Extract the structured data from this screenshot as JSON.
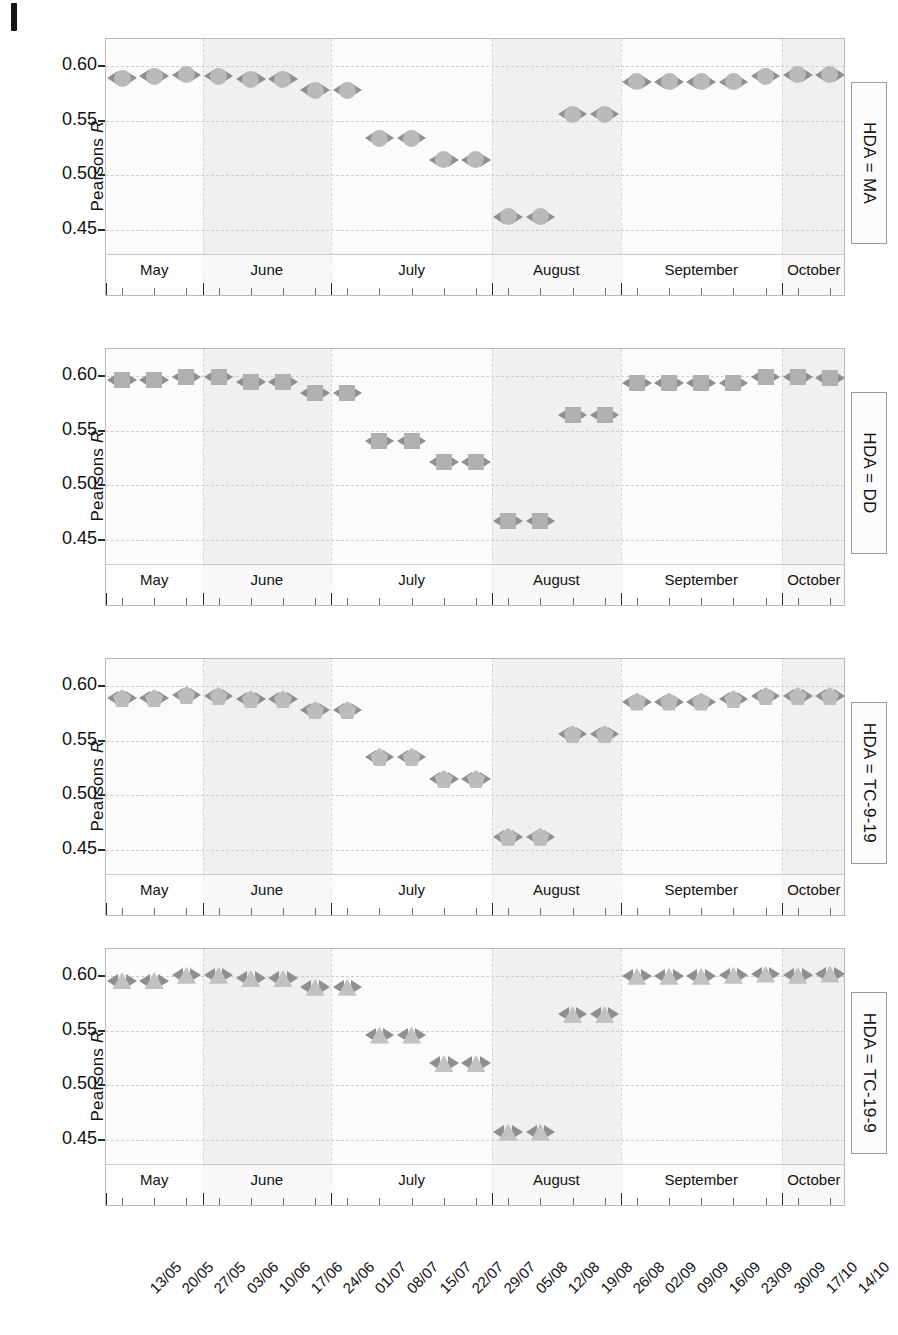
{
  "figure": {
    "y_axis_label": "Pearsons R",
    "y_axis_label_plain": "Pearsons",
    "y_axis_label_italic": "R"
  },
  "chart_data": {
    "type": "scatter",
    "title": "",
    "xlabel": "",
    "ylabel": "Pearsons R",
    "ylim": [
      0.425,
      0.625
    ],
    "yticks": [
      0.45,
      0.5,
      0.55,
      0.6
    ],
    "ytick_labels": [
      "0.45",
      "0.50",
      "0.55",
      "0.60"
    ],
    "grid": true,
    "legend": "none",
    "error_bars": "horizontal, arrow-capped, dashed",
    "x": [
      "13/05",
      "20/05",
      "27/05",
      "03/06",
      "10/06",
      "17/06",
      "24/06",
      "01/07",
      "08/07",
      "15/07",
      "22/07",
      "29/07",
      "05/08",
      "12/08",
      "19/08",
      "26/08",
      "02/09",
      "09/09",
      "16/09",
      "23/09",
      "30/09",
      "17/10",
      "14/10"
    ],
    "xtick_labels": [
      "13/05",
      "20/05",
      "27/05",
      "03/06",
      "10/06",
      "17/06",
      "24/06",
      "01/07",
      "08/07",
      "15/07",
      "22/07",
      "29/07",
      "05/08",
      "12/08",
      "19/08",
      "26/08",
      "02/09",
      "09/09",
      "16/09",
      "23/09",
      "30/09",
      "17/10",
      "14/10"
    ],
    "months": [
      {
        "label": "May",
        "start": "13/05",
        "end": "27/05",
        "shaded": false
      },
      {
        "label": "June",
        "start": "03/06",
        "end": "24/06",
        "shaded": true
      },
      {
        "label": "July",
        "start": "01/07",
        "end": "29/07",
        "shaded": false
      },
      {
        "label": "August",
        "start": "05/08",
        "end": "26/08",
        "shaded": true
      },
      {
        "label": "September",
        "start": "02/09",
        "end": "30/09",
        "shaded": false
      },
      {
        "label": "October",
        "start": "17/10",
        "end": "14/10",
        "shaded": true
      }
    ],
    "panels": [
      {
        "strip_label": "HDA = MA",
        "marker": "circle",
        "marker_color": "#b9b9b9",
        "points": [
          {
            "x": "13/05",
            "y": 0.589
          },
          {
            "x": "20/05",
            "y": 0.591
          },
          {
            "x": "27/05",
            "y": 0.592
          },
          {
            "x": "03/06",
            "y": 0.591
          },
          {
            "x": "10/06",
            "y": 0.588
          },
          {
            "x": "17/06",
            "y": 0.588
          },
          {
            "x": "24/06",
            "y": 0.578
          },
          {
            "x": "01/07",
            "y": 0.578
          },
          {
            "x": "08/07",
            "y": 0.534
          },
          {
            "x": "15/07",
            "y": 0.534
          },
          {
            "x": "22/07",
            "y": 0.514
          },
          {
            "x": "29/07",
            "y": 0.514
          },
          {
            "x": "05/08",
            "y": 0.462
          },
          {
            "x": "12/08",
            "y": 0.462
          },
          {
            "x": "19/08",
            "y": 0.556
          },
          {
            "x": "26/08",
            "y": 0.556
          },
          {
            "x": "02/09",
            "y": 0.586
          },
          {
            "x": "09/09",
            "y": 0.586
          },
          {
            "x": "16/09",
            "y": 0.586
          },
          {
            "x": "23/09",
            "y": 0.586
          },
          {
            "x": "30/09",
            "y": 0.591
          },
          {
            "x": "17/10",
            "y": 0.592
          },
          {
            "x": "14/10",
            "y": 0.592
          }
        ]
      },
      {
        "strip_label": "HDA = DD",
        "marker": "square",
        "marker_color": "#b0b0b0",
        "points": [
          {
            "x": "13/05",
            "y": 0.597
          },
          {
            "x": "20/05",
            "y": 0.597
          },
          {
            "x": "27/05",
            "y": 0.599
          },
          {
            "x": "03/06",
            "y": 0.599
          },
          {
            "x": "10/06",
            "y": 0.595
          },
          {
            "x": "17/06",
            "y": 0.595
          },
          {
            "x": "24/06",
            "y": 0.585
          },
          {
            "x": "01/07",
            "y": 0.585
          },
          {
            "x": "08/07",
            "y": 0.541
          },
          {
            "x": "15/07",
            "y": 0.541
          },
          {
            "x": "22/07",
            "y": 0.521
          },
          {
            "x": "29/07",
            "y": 0.521
          },
          {
            "x": "05/08",
            "y": 0.467
          },
          {
            "x": "12/08",
            "y": 0.467
          },
          {
            "x": "19/08",
            "y": 0.564
          },
          {
            "x": "26/08",
            "y": 0.564
          },
          {
            "x": "02/09",
            "y": 0.594
          },
          {
            "x": "09/09",
            "y": 0.594
          },
          {
            "x": "16/09",
            "y": 0.594
          },
          {
            "x": "23/09",
            "y": 0.594
          },
          {
            "x": "30/09",
            "y": 0.599
          },
          {
            "x": "17/10",
            "y": 0.599
          },
          {
            "x": "14/10",
            "y": 0.598
          }
        ]
      },
      {
        "strip_label": "HDA = TC-9-19",
        "marker": "pentagon",
        "marker_color": "#bcbcbc",
        "points": [
          {
            "x": "13/05",
            "y": 0.589
          },
          {
            "x": "20/05",
            "y": 0.589
          },
          {
            "x": "27/05",
            "y": 0.592
          },
          {
            "x": "03/06",
            "y": 0.591
          },
          {
            "x": "10/06",
            "y": 0.588
          },
          {
            "x": "17/06",
            "y": 0.588
          },
          {
            "x": "24/06",
            "y": 0.578
          },
          {
            "x": "01/07",
            "y": 0.578
          },
          {
            "x": "08/07",
            "y": 0.535
          },
          {
            "x": "15/07",
            "y": 0.535
          },
          {
            "x": "22/07",
            "y": 0.515
          },
          {
            "x": "29/07",
            "y": 0.515
          },
          {
            "x": "05/08",
            "y": 0.462
          },
          {
            "x": "12/08",
            "y": 0.462
          },
          {
            "x": "19/08",
            "y": 0.556
          },
          {
            "x": "26/08",
            "y": 0.556
          },
          {
            "x": "02/09",
            "y": 0.586
          },
          {
            "x": "09/09",
            "y": 0.586
          },
          {
            "x": "16/09",
            "y": 0.586
          },
          {
            "x": "23/09",
            "y": 0.588
          },
          {
            "x": "30/09",
            "y": 0.591
          },
          {
            "x": "17/10",
            "y": 0.591
          },
          {
            "x": "14/10",
            "y": 0.591
          }
        ]
      },
      {
        "strip_label": "HDA = TC-19-9",
        "marker": "triangle",
        "marker_color": "#c2c2c2",
        "points": [
          {
            "x": "13/05",
            "y": 0.596
          },
          {
            "x": "20/05",
            "y": 0.596
          },
          {
            "x": "27/05",
            "y": 0.601
          },
          {
            "x": "03/06",
            "y": 0.601
          },
          {
            "x": "10/06",
            "y": 0.598
          },
          {
            "x": "17/06",
            "y": 0.598
          },
          {
            "x": "24/06",
            "y": 0.59
          },
          {
            "x": "01/07",
            "y": 0.59
          },
          {
            "x": "08/07",
            "y": 0.546
          },
          {
            "x": "15/07",
            "y": 0.546
          },
          {
            "x": "22/07",
            "y": 0.52
          },
          {
            "x": "29/07",
            "y": 0.52
          },
          {
            "x": "05/08",
            "y": 0.457
          },
          {
            "x": "12/08",
            "y": 0.457
          },
          {
            "x": "19/08",
            "y": 0.565
          },
          {
            "x": "26/08",
            "y": 0.565
          },
          {
            "x": "02/09",
            "y": 0.6
          },
          {
            "x": "09/09",
            "y": 0.6
          },
          {
            "x": "16/09",
            "y": 0.6
          },
          {
            "x": "23/09",
            "y": 0.601
          },
          {
            "x": "30/09",
            "y": 0.602
          },
          {
            "x": "17/10",
            "y": 0.601
          },
          {
            "x": "14/10",
            "y": 0.602
          }
        ]
      }
    ]
  }
}
